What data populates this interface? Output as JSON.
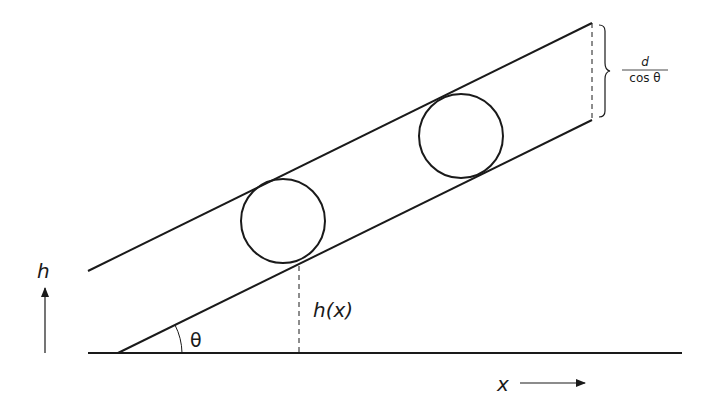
{
  "diagram": {
    "labels": {
      "h_axis": "h",
      "x_axis": "x",
      "theta": "θ",
      "height_func": "h(x)",
      "fraction_numerator": "d",
      "fraction_denominator": "cos θ"
    },
    "colors": {
      "stroke": "#1a1a1a",
      "background": "#ffffff"
    },
    "geometry": {
      "ground_line": {
        "x1": 88,
        "y1": 353,
        "x2": 682,
        "y2": 353
      },
      "lower_incline": {
        "x1": 118,
        "y1": 353,
        "x2": 592,
        "y2": 120
      },
      "upper_incline": {
        "x1": 88,
        "y1": 271,
        "x2": 592,
        "y2": 23
      },
      "circles": [
        {
          "cx": 283,
          "cy": 221,
          "r": 42
        },
        {
          "cx": 461,
          "cy": 136,
          "r": 42
        }
      ],
      "dashed_height_line": {
        "x": 299,
        "y1": 266,
        "y2": 353
      },
      "dashed_width_line": {
        "x": 592,
        "y1": 23,
        "y2": 120
      }
    }
  }
}
